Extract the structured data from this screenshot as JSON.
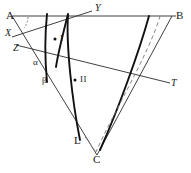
{
  "figure": {
    "type": "geometry-diagram",
    "width": 191,
    "height": 173,
    "background_color": "#ffffff",
    "stroke_color": "#1a1a1a",
    "labels": {
      "A": "A",
      "B": "B",
      "C": "C",
      "X": "X",
      "Y": "Y",
      "Z": "Z",
      "T": "T",
      "L": "L",
      "alpha": "α",
      "beta": "β",
      "region_one": "I",
      "region_two": "II"
    },
    "points": {
      "A": {
        "x": 12,
        "y": 16
      },
      "B": {
        "x": 172,
        "y": 16
      },
      "C": {
        "x": 97,
        "y": 155
      },
      "X": {
        "x": 17,
        "y": 33
      },
      "Y": {
        "x": 93,
        "y": 10
      },
      "Z": {
        "x": 22,
        "y": 47
      },
      "T": {
        "x": 168,
        "y": 83
      },
      "L": {
        "x": 80,
        "y": 140
      },
      "alpha": {
        "x": 37,
        "y": 62
      },
      "beta": {
        "x": 46,
        "y": 81
      },
      "region_one_dot": {
        "x": 57,
        "y": 38
      },
      "region_two_dot": {
        "x": 78,
        "y": 79
      }
    },
    "annotations": {
      "angle_arc_at_A": "angle-arc",
      "dot_marker_region_one": "region-marker-dot",
      "dot_marker_region_two": "region-marker-dot"
    }
  }
}
